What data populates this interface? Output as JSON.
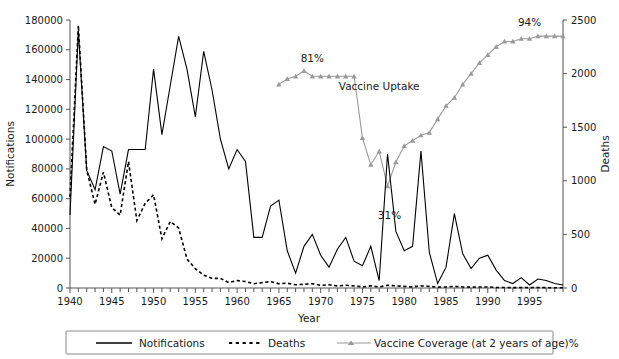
{
  "chart_data": {
    "type": "line",
    "title": "",
    "xlabel": "Year",
    "ylabel": "Notifications",
    "y2label": "Deaths",
    "xlim": [
      1940,
      1999
    ],
    "ylim": [
      0,
      180000
    ],
    "y2lim": [
      0,
      2500
    ],
    "grid": false,
    "legend_position": "bottom",
    "xticks_major": [
      1940,
      1945,
      1950,
      1955,
      1960,
      1965,
      1970,
      1975,
      1980,
      1985,
      1990,
      1995
    ],
    "xtick_labels": [
      "1940",
      "1945",
      "1950",
      "1955",
      "1960",
      "1965",
      "1970",
      "1975",
      "1980",
      "1985",
      "1990",
      "1995"
    ],
    "xtick_minor_step": 1,
    "yticks": [
      0,
      20000,
      40000,
      60000,
      80000,
      100000,
      120000,
      140000,
      160000,
      180000
    ],
    "ytick_labels": [
      "0",
      "20000",
      "40000",
      "60000",
      "80000",
      "100000",
      "120000",
      "140000",
      "160000",
      "180000"
    ],
    "y2ticks": [
      0,
      500,
      1000,
      1500,
      2000,
      2500
    ],
    "y2tick_labels": [
      "0",
      "500",
      "1000",
      "1500",
      "2000",
      "2500"
    ],
    "annotations": [
      {
        "text": "81%",
        "x": 1969,
        "y_pct": 81,
        "name": "annotation-81-percent"
      },
      {
        "text": "31%",
        "x": 1978,
        "y_pct": 31,
        "name": "annotation-31-percent"
      },
      {
        "text": "94%",
        "x": 1995,
        "y_pct": 94,
        "name": "annotation-94-percent"
      },
      {
        "text": "Vaccine Uptake",
        "x": 1977,
        "y_pct": 74,
        "name": "annotation-vaccine-uptake"
      }
    ],
    "series": [
      {
        "name": "Notifications",
        "axis": "left",
        "style": "solid",
        "color": "#000000",
        "x": [
          1940,
          1941,
          1942,
          1943,
          1944,
          1945,
          1946,
          1947,
          1948,
          1949,
          1950,
          1951,
          1952,
          1953,
          1954,
          1955,
          1956,
          1957,
          1958,
          1959,
          1960,
          1961,
          1962,
          1963,
          1964,
          1965,
          1966,
          1967,
          1968,
          1969,
          1970,
          1971,
          1972,
          1973,
          1974,
          1975,
          1976,
          1977,
          1978,
          1979,
          1980,
          1981,
          1982,
          1983,
          1984,
          1985,
          1986,
          1987,
          1988,
          1989,
          1990,
          1991,
          1992,
          1993,
          1994,
          1995,
          1996,
          1997,
          1998,
          1999
        ],
        "values": [
          49000,
          173000,
          79000,
          66000,
          95000,
          92000,
          63000,
          93000,
          93000,
          93000,
          147000,
          103000,
          136000,
          169000,
          147000,
          115000,
          159000,
          133000,
          100000,
          80000,
          93000,
          85000,
          34000,
          34000,
          55000,
          59000,
          25000,
          10000,
          28000,
          36000,
          22000,
          14000,
          26000,
          34000,
          18000,
          15000,
          28000,
          5000,
          90000,
          38000,
          25000,
          28000,
          92000,
          24000,
          3000,
          14000,
          50000,
          23000,
          13000,
          20000,
          22000,
          12000,
          5000,
          3000,
          7000,
          2000,
          6000,
          5000,
          3000,
          2000
        ]
      },
      {
        "name": "Deaths",
        "axis": "right",
        "style": "dashed",
        "color": "#000000",
        "x": [
          1940,
          1941,
          1942,
          1943,
          1944,
          1945,
          1946,
          1947,
          1948,
          1949,
          1950,
          1951,
          1952,
          1953,
          1954,
          1955,
          1956,
          1957,
          1958,
          1959,
          1960,
          1961,
          1962,
          1963,
          1964,
          1965,
          1966,
          1967,
          1968,
          1969,
          1970,
          1971,
          1972,
          1973,
          1974,
          1975,
          1976,
          1977,
          1978,
          1979,
          1980,
          1981,
          1982,
          1983,
          1984,
          1985,
          1986,
          1987,
          1988,
          1989,
          1990,
          1991,
          1992,
          1993,
          1994,
          1995,
          1996,
          1997,
          1998,
          1999
        ],
        "values": [
          850,
          2450,
          1100,
          780,
          1080,
          750,
          680,
          1180,
          630,
          790,
          870,
          460,
          620,
          560,
          270,
          180,
          120,
          90,
          90,
          50,
          70,
          60,
          40,
          50,
          60,
          40,
          45,
          30,
          35,
          40,
          25,
          30,
          20,
          25,
          20,
          10,
          20,
          10,
          25,
          20,
          15,
          10,
          20,
          15,
          8,
          10,
          15,
          10,
          8,
          10,
          10,
          5,
          5,
          3,
          5,
          3,
          5,
          3,
          3,
          3
        ]
      },
      {
        "name": "Vaccine Coverage (at 2 years of age)%",
        "axis": "percent",
        "style": "solid-marker",
        "color": "#9a9a9a",
        "x": [
          1965,
          1966,
          1967,
          1968,
          1969,
          1970,
          1971,
          1972,
          1973,
          1974,
          1975,
          1976,
          1977,
          1978,
          1979,
          1980,
          1981,
          1982,
          1983,
          1984,
          1985,
          1986,
          1987,
          1988,
          1989,
          1990,
          1991,
          1992,
          1993,
          1994,
          1995,
          1996,
          1997,
          1998,
          1999
        ],
        "values": [
          76,
          78,
          79,
          81,
          79,
          79,
          79,
          79,
          79,
          79,
          56,
          46,
          51,
          38,
          47,
          53,
          55,
          57,
          58,
          63,
          68,
          71,
          76,
          80,
          84,
          87,
          90,
          92,
          92,
          93,
          93,
          94,
          94,
          94,
          94
        ]
      }
    ]
  },
  "axes": {
    "left_title": "Notifications",
    "right_title": "Deaths",
    "x_title": "Year"
  },
  "legend": {
    "items": [
      {
        "label": "Notifications",
        "marker": "solid-line",
        "color": "#000000"
      },
      {
        "label": "Deaths",
        "marker": "dashed-line",
        "color": "#000000"
      },
      {
        "label": "Vaccine Coverage (at 2 years of age)%",
        "marker": "line-with-triangle",
        "color": "#9a9a9a"
      }
    ]
  }
}
